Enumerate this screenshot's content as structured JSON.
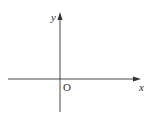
{
  "diagram": {
    "type": "coordinate-axes",
    "x_axis_label": "x",
    "y_axis_label": "y",
    "origin_label": "O",
    "axis_color": "#333333"
  }
}
